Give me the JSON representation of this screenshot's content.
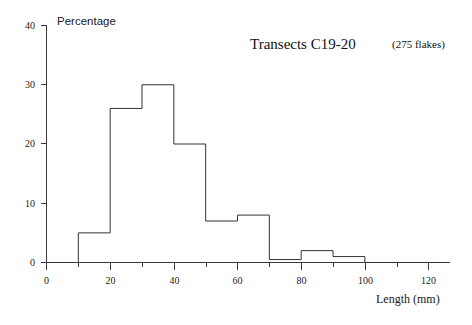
{
  "chart_data": {
    "type": "bar",
    "title": "Transects C19-20",
    "subtitle": "(275 flakes)",
    "xlabel": "Length  (mm)",
    "ylabel": "Percentage",
    "xlim": [
      0,
      125
    ],
    "ylim": [
      0,
      40
    ],
    "grid": false,
    "legend": "none",
    "bin_width": 10,
    "bin_edges": [
      0,
      10,
      20,
      30,
      40,
      50,
      60,
      70,
      80,
      90,
      100,
      110,
      120,
      125
    ],
    "categories": [
      "0-10",
      "10-20",
      "20-30",
      "30-40",
      "40-50",
      "50-60",
      "60-70",
      "70-80",
      "80-90",
      "90-100",
      "100-110",
      "110-120",
      "120-125"
    ],
    "values": [
      0,
      5,
      26,
      30,
      20,
      7,
      8,
      0.5,
      2,
      1,
      0,
      0,
      0
    ],
    "x_tick_values": [
      0,
      20,
      40,
      60,
      80,
      100,
      120
    ],
    "x_tick_labels": [
      "0",
      "20",
      "40",
      "60",
      "80",
      "100",
      "120"
    ],
    "x_minor_ticks": [
      10,
      30,
      50,
      70,
      90,
      110
    ],
    "y_tick_values": [
      0,
      10,
      20,
      30,
      40
    ],
    "y_tick_labels": [
      "0",
      "10",
      "20",
      "30",
      "40"
    ],
    "series_color": "#333333",
    "axis_color": "#3b3b3b"
  },
  "labels": {
    "title_main": "Transects C19-20",
    "title_sub": "(275 flakes)",
    "y_axis_name": "Percentage",
    "x_axis_name": "Length  (mm)",
    "y0": "0",
    "y10": "10",
    "y20": "20",
    "y30": "30",
    "y40": "40",
    "x0": "0",
    "x20": "20",
    "x40": "40",
    "x60": "60",
    "x80": "80",
    "x100": "100",
    "x120": "120"
  }
}
